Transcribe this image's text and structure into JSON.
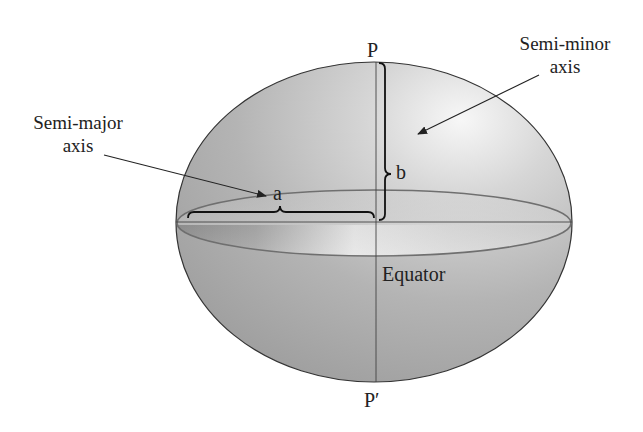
{
  "diagram": {
    "labels": {
      "north_pole": "P",
      "south_pole": "P′",
      "semi_major_line1": "Semi-major",
      "semi_major_line2": "axis",
      "semi_minor_line1": "Semi-minor",
      "semi_minor_line2": "axis",
      "a": "a",
      "b": "b",
      "equator": "Equator"
    },
    "colors": {
      "ellipsoid_fill_light": "#eeeeee",
      "ellipsoid_fill_dark": "#9a9a9a",
      "outline": "#333333",
      "equator_stroke": "#777777",
      "text": "#222222"
    }
  }
}
